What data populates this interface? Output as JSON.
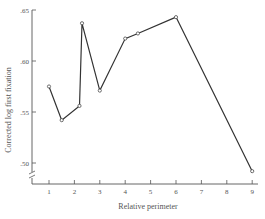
{
  "chart_data": {
    "type": "line",
    "title": "",
    "xlabel": "Relative perimeter",
    "ylabel": "Corrected log first fixation",
    "xlim": [
      0.5,
      9.5
    ],
    "ylim": [
      0.48,
      0.65
    ],
    "x_ticks": [
      1,
      2,
      3,
      4,
      5,
      6,
      7,
      8,
      9
    ],
    "y_ticks": [
      ".50",
      ".55",
      ".60",
      ".65"
    ],
    "y_tick_values": [
      0.5,
      0.55,
      0.6,
      0.65
    ],
    "axis_break": true,
    "grid": false,
    "legend": null,
    "series": [
      {
        "name": "Corrected log first fixation",
        "marker": "open-circle",
        "x": [
          1.0,
          1.5,
          2.2,
          2.3,
          3.0,
          4.0,
          4.5,
          6.0,
          9.0
        ],
        "y": [
          0.575,
          0.542,
          0.556,
          0.637,
          0.571,
          0.622,
          0.627,
          0.643,
          0.492
        ]
      }
    ]
  },
  "colors": {
    "line": "#333333",
    "axis": "#555555",
    "background": "#ffffff"
  }
}
